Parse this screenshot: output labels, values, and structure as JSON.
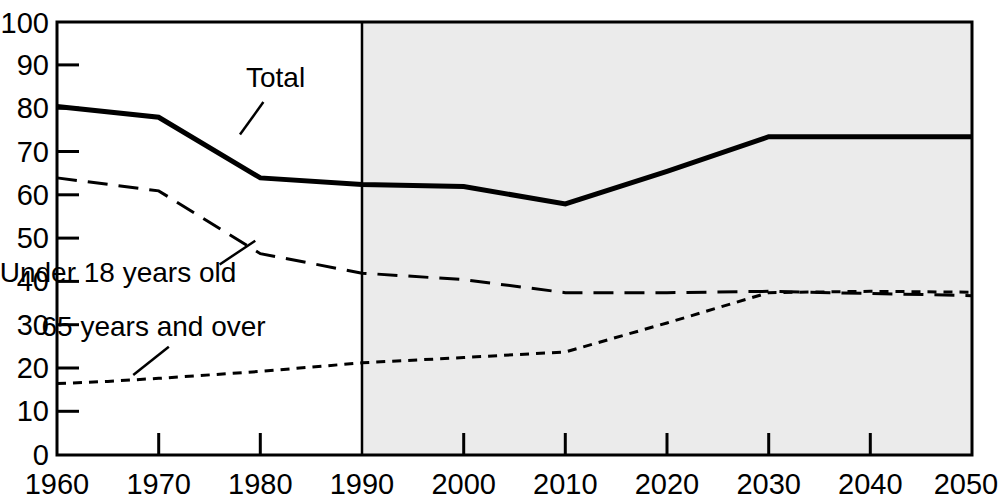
{
  "chart_data": {
    "type": "line",
    "title": "",
    "subtitle": "",
    "xlabel": "",
    "ylabel": "",
    "xlim": [
      1960,
      2050
    ],
    "ylim": [
      0,
      100
    ],
    "grid": false,
    "legend_position": "inline-annotations",
    "x": [
      1960,
      1965,
      1970,
      1980,
      1990,
      2000,
      2010,
      2020,
      2030,
      2040,
      2050
    ],
    "xticks": [
      "1960",
      "1970",
      "1980",
      "1990",
      "2000",
      "2010",
      "2020",
      "2030",
      "2040",
      "2050"
    ],
    "xtick_values": [
      1960,
      1970,
      1980,
      1990,
      2000,
      2010,
      2020,
      2030,
      2040,
      2050
    ],
    "yticks": [
      "0",
      "10",
      "20",
      "30",
      "40",
      "50",
      "60",
      "70",
      "80",
      "90",
      "100"
    ],
    "ytick_values": [
      0,
      10,
      20,
      30,
      40,
      50,
      60,
      70,
      80,
      90,
      100
    ],
    "series": [
      {
        "name": "Total",
        "style": "solid-thick",
        "x": [
          1960,
          1970,
          1980,
          1990,
          2000,
          2010,
          2020,
          2030,
          2040,
          2050
        ],
        "values": [
          80.5,
          78.0,
          64.0,
          62.5,
          62.0,
          58.0,
          65.5,
          73.5,
          73.5,
          73.5
        ]
      },
      {
        "name": "Under 18 years old",
        "style": "long-dash",
        "x": [
          1960,
          1970,
          1980,
          1990,
          2000,
          2010,
          2020,
          2030,
          2040,
          2050
        ],
        "values": [
          64.0,
          61.0,
          46.5,
          42.0,
          40.5,
          37.5,
          37.5,
          37.8,
          37.3,
          36.8
        ]
      },
      {
        "name": "65 years and over",
        "style": "short-dash",
        "x": [
          1960,
          1965,
          1970,
          1980,
          1990,
          2000,
          2010,
          2020,
          2030,
          2040,
          2050
        ],
        "values": [
          16.5,
          17.0,
          17.7,
          19.3,
          21.3,
          22.5,
          23.8,
          30.5,
          37.5,
          37.8,
          37.6
        ]
      }
    ],
    "annotations": [
      {
        "name": "total-label",
        "text": "Total",
        "x": 1981.5,
        "y": 85.0,
        "leader_to_x": 1978.0,
        "leader_to_y": 74.0
      },
      {
        "name": "under18-label",
        "text": "Under 18 years old",
        "x": 1966.0,
        "y": 40.0,
        "leader_from_x": 1976.0,
        "leader_from_y": 44.0,
        "leader_to_x": 1979.5,
        "leader_to_y": 49.5
      },
      {
        "name": "over65-label",
        "text": "65 years and over",
        "x": 1969.5,
        "y": 27.5,
        "leader_from_x": 1967.5,
        "leader_from_y": 18.5,
        "leader_to_x": 1971.0,
        "leader_to_y": 25.0
      }
    ],
    "projection": {
      "name": "projection-shading",
      "start_year": 1990,
      "end_year": 2050,
      "shade_color": "#ebebeb"
    },
    "colors": {
      "axis": "#000000",
      "series": "#000000",
      "background": "#ffffff",
      "projection_band": "#ebebeb"
    }
  }
}
